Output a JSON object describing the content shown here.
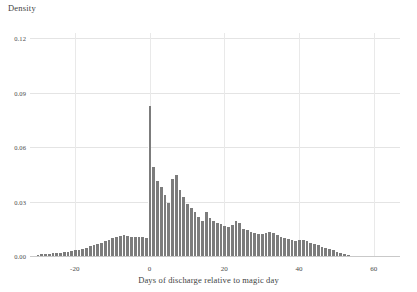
{
  "chart_data": {
    "type": "bar",
    "title": "",
    "ylabel": "Density",
    "xlabel": "Days of discharge relative to magic day",
    "xlim": [
      -32,
      67
    ],
    "ylim": [
      0.0,
      0.1235
    ],
    "grid": true,
    "legend": null,
    "bar_color": "#7c7c7c",
    "bin_width": 1,
    "xticks": [
      -20,
      0,
      20,
      40,
      60
    ],
    "xtick_labels": [
      "-20",
      "0",
      "20",
      "40",
      "60"
    ],
    "yticks": [
      0.0,
      0.03,
      0.06,
      0.09,
      0.12
    ],
    "ytick_labels": [
      "0.00",
      "0.03",
      "0.06",
      "0.09",
      "0.12"
    ],
    "x": [
      -30,
      -29,
      -28,
      -27,
      -26,
      -25,
      -24,
      -23,
      -22,
      -21,
      -20,
      -19,
      -18,
      -17,
      -16,
      -15,
      -14,
      -13,
      -12,
      -11,
      -10,
      -9,
      -8,
      -7,
      -6,
      -5,
      -4,
      -3,
      -2,
      -1,
      0,
      1,
      2,
      3,
      4,
      5,
      6,
      7,
      8,
      9,
      10,
      11,
      12,
      13,
      14,
      15,
      16,
      17,
      18,
      19,
      20,
      21,
      22,
      23,
      24,
      25,
      26,
      27,
      28,
      29,
      30,
      31,
      32,
      33,
      34,
      35,
      36,
      37,
      38,
      39,
      40,
      41,
      42,
      43,
      44,
      45,
      46,
      47,
      48,
      49,
      50,
      51,
      52,
      53
    ],
    "values": [
      0.0012,
      0.0014,
      0.0016,
      0.0018,
      0.002,
      0.0022,
      0.0024,
      0.0026,
      0.0028,
      0.0032,
      0.0036,
      0.004,
      0.0046,
      0.0052,
      0.0058,
      0.0064,
      0.007,
      0.0078,
      0.0086,
      0.0094,
      0.0104,
      0.0112,
      0.0118,
      0.012,
      0.0116,
      0.0112,
      0.011,
      0.0112,
      0.011,
      0.0106,
      0.0835,
      0.0495,
      0.042,
      0.0385,
      0.034,
      0.03,
      0.043,
      0.045,
      0.037,
      0.033,
      0.0295,
      0.0268,
      0.025,
      0.0218,
      0.0196,
      0.0246,
      0.0214,
      0.0196,
      0.0188,
      0.018,
      0.0172,
      0.0166,
      0.0178,
      0.0196,
      0.0186,
      0.0156,
      0.0148,
      0.0138,
      0.0132,
      0.0128,
      0.0126,
      0.0134,
      0.0136,
      0.013,
      0.0122,
      0.0112,
      0.0104,
      0.0098,
      0.0092,
      0.0088,
      0.0092,
      0.0096,
      0.009,
      0.008,
      0.0072,
      0.0064,
      0.0056,
      0.0048,
      0.0042,
      0.0036,
      0.003,
      0.0024,
      0.0018,
      0.0012
    ]
  }
}
